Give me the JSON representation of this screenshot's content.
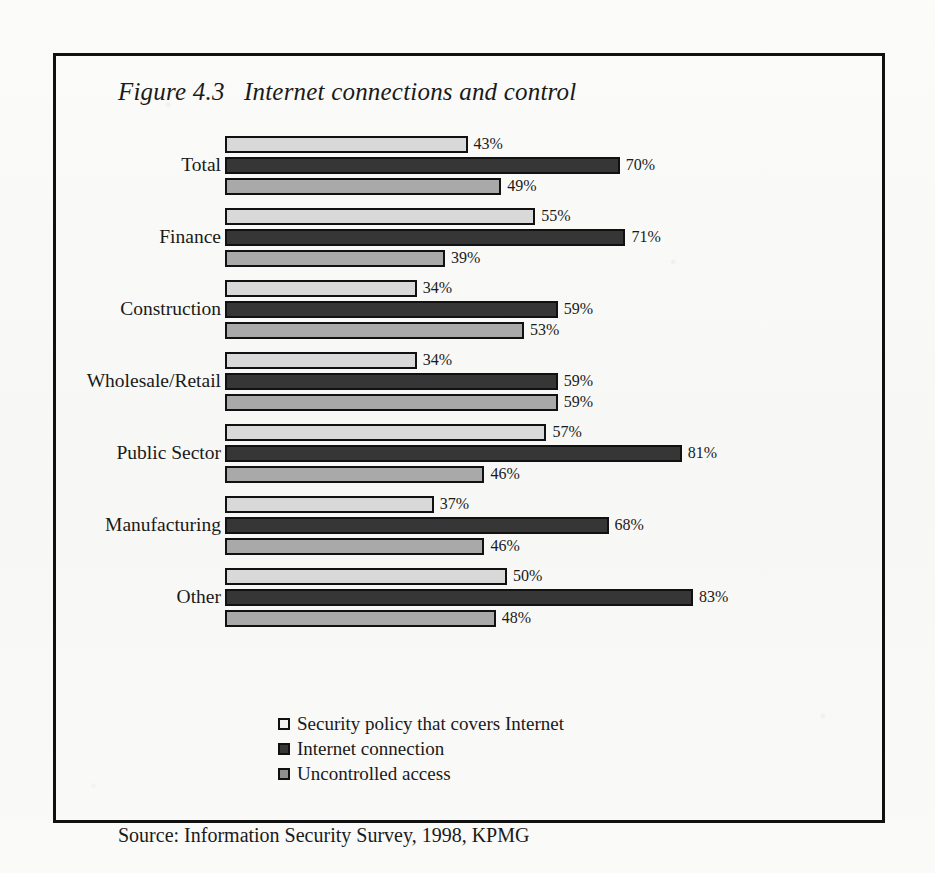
{
  "figure": {
    "title": "Figure 4.3   Internet connections and control",
    "source": "Source: Information Security Survey, 1998, KPMG"
  },
  "colors": {
    "series_security_policy": "#d9d9d9",
    "series_internet_connection": "#363636",
    "series_uncontrolled_access": "#a9a9a9",
    "border": "#111111",
    "background": "#fbfbfa"
  },
  "chart_data": {
    "type": "bar",
    "orientation": "horizontal",
    "title": "Figure 4.3   Internet connections and control",
    "xlabel": "",
    "ylabel": "",
    "xlim": [
      0,
      100
    ],
    "grid": false,
    "legend_position": "bottom-left",
    "value_suffix": "%",
    "categories": [
      "Total",
      "Finance",
      "Construction",
      "Wholesale/Retail",
      "Public Sector",
      "Manufacturing",
      "Other"
    ],
    "series": [
      {
        "name": "Security policy that covers Internet",
        "values": [
          43,
          55,
          34,
          34,
          57,
          37,
          50
        ],
        "labels": [
          "43%",
          "55%",
          "34%",
          "34%",
          "57%",
          "37%",
          "50%"
        ]
      },
      {
        "name": "Internet connection",
        "values": [
          70,
          71,
          59,
          59,
          81,
          68,
          83
        ],
        "labels": [
          "70%",
          "71%",
          "59%",
          "59%",
          "81%",
          "68%",
          "83%"
        ]
      },
      {
        "name": "Uncontrolled access",
        "values": [
          49,
          39,
          53,
          59,
          46,
          46,
          48
        ],
        "labels": [
          "49%",
          "39%",
          "53%",
          "59%",
          "46%",
          "46%",
          "48%"
        ]
      }
    ]
  },
  "legend": [
    {
      "label": "Security policy that covers Internet"
    },
    {
      "label": "Internet connection"
    },
    {
      "label": "Uncontrolled access"
    }
  ]
}
